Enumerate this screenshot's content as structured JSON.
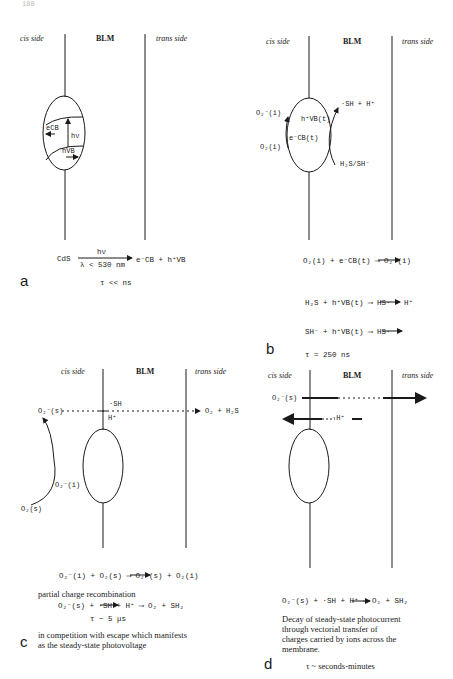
{
  "page": {
    "number": "188"
  },
  "headers": {
    "cis": "cis side",
    "blm": "BLM",
    "trans": "trans side"
  },
  "panel_a": {
    "letter": "a",
    "band_labels": {
      "electron": "eCB",
      "hole": "hVB",
      "photon": "hν"
    },
    "reaction": {
      "reactant": "CdS",
      "above_arrow": "hν",
      "below_arrow": "λ < 530 nm",
      "products": "e⁻CB + h⁺VB"
    },
    "tau": "τ << ns"
  },
  "panel_b": {
    "letter": "b",
    "labels": {
      "o2_radical_i": "O₂⁻(i)",
      "o2_i": "O₂(i)",
      "hole": "h⁺VB(t)",
      "electron": "e⁻CB(t)",
      "sh_h": "·SH + H⁺",
      "h2s_sh": "H₂S/SH⁻"
    },
    "reactions": [
      "O₂(i) + e⁻CB(t) ⟶ O₂⁻(i)",
      "H₂S + h⁺VB(t) ⟶ HS· + H⁺",
      "SH⁻ + h⁺VB(t) ⟶ HS·"
    ],
    "tau": "τ = 250 ns"
  },
  "panel_c": {
    "letter": "c",
    "labels": {
      "o2_radical_s": "O₂⁻(s)",
      "sh": "·SH",
      "h_plus": "H⁺",
      "products": "O₂ + H₂S",
      "o2_radical_i": "O₂⁻(i)",
      "o2_s": "O₂(s)"
    },
    "reactions": [
      "O₂⁻(i) + O₂(s) ⟶ O₂⁻(s) + O₂(i)",
      "O₂⁻(s) + ·SH + H⁺ ⟶ O₂ + SH₂"
    ],
    "note1": "partial charge recombination",
    "tau": "τ ~ 5 μs",
    "note2_line1": "in competition with escape which manifests",
    "note2_line2": "as the steady-state photovoltage"
  },
  "panel_d": {
    "letter": "d",
    "labels": {
      "o2_radical_s": "O₂⁻(s)",
      "h_plus": "·H⁺"
    },
    "reaction": "O₂⁻(s) + ·SH + H⁺ ⟶ O₂ + SH₂",
    "note_lines": [
      "Decay of steady-state photocurrent",
      "through vectorial transfer of",
      "charges carried by ions across the",
      "membrane."
    ],
    "tau": "τ ~ seconds-minutes"
  }
}
